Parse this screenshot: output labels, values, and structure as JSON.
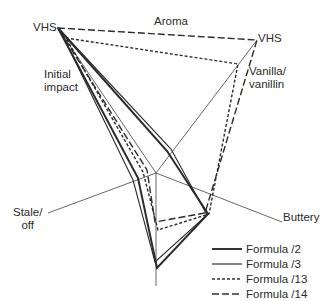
{
  "chart_data": {
    "type": "radar",
    "title": "Aroma",
    "scale_max_label": "VHS",
    "center": [
      156,
      173
    ],
    "axes": [
      {
        "name": "Initial impact",
        "label": "Initial\nimpact",
        "end": [
          58,
          28
        ],
        "label_pos": [
          96,
          68
        ]
      },
      {
        "name": "Vanilla/vanillin",
        "label": "Vanilla/\nvanillin",
        "end": [
          257,
          40
        ],
        "label_pos": [
          250,
          64
        ]
      },
      {
        "name": "Buttery",
        "label": "Buttery",
        "end": [
          282,
          222
        ],
        "label_pos": [
          283,
          226
        ]
      },
      {
        "name": "Unlabeled (bottom)",
        "label": "",
        "end": [
          156,
          286
        ],
        "label_pos": [
          0,
          0
        ]
      },
      {
        "name": "Stale/off",
        "label": "Stale/\noff",
        "end": [
          48,
          213
        ],
        "label_pos": [
          12,
          214
        ]
      }
    ],
    "series": [
      {
        "name": "Formula /2",
        "style": "solid-thick",
        "points": [
          [
            58,
            28
          ],
          [
            167,
            151
          ],
          [
            208,
            214
          ],
          [
            157,
            268
          ],
          [
            138,
            178
          ]
        ],
        "values": [
          1.0,
          0.25,
          0.46,
          0.84,
          0.17
        ]
      },
      {
        "name": "Formula /3",
        "style": "solid-thin",
        "points": [
          [
            60,
            30
          ],
          [
            171,
            149
          ],
          [
            207,
            215
          ],
          [
            155,
            262
          ],
          [
            133,
            180
          ]
        ],
        "values": [
          0.98,
          0.28,
          0.45,
          0.79,
          0.21
        ]
      },
      {
        "name": "Formula /13",
        "style": "short-dash",
        "points": [
          [
            66,
            38
          ],
          [
            238,
            64
          ],
          [
            209,
            214
          ],
          [
            158,
            230
          ],
          [
            143,
            172
          ]
        ],
        "values": [
          0.92,
          0.82,
          0.46,
          0.5,
          0.12
        ]
      },
      {
        "name": "Formula /14",
        "style": "long-dash",
        "points": [
          [
            58,
            28
          ],
          [
            257,
            40
          ],
          [
            205,
            213
          ],
          [
            155,
            222
          ],
          [
            147,
            170
          ]
        ],
        "values": [
          1.0,
          1.0,
          0.42,
          0.43,
          0.08
        ]
      }
    ],
    "legend_position": "bottom-right"
  },
  "labels": {
    "vhs_left": "VHS",
    "aroma": "Aroma",
    "vhs_right": "VHS",
    "vanilla": "Vanilla/\nvanillin",
    "initial": "Initial\nimpact",
    "buttery": "Buttery",
    "stale": "Stale/\noff"
  },
  "legend": [
    {
      "label": "Formula /2",
      "style": "solid-thick"
    },
    {
      "label": "Formula /3",
      "style": "solid-thin"
    },
    {
      "label": "Formula /13",
      "style": "short-dash"
    },
    {
      "label": "Formula /14",
      "style": "long-dash"
    }
  ]
}
